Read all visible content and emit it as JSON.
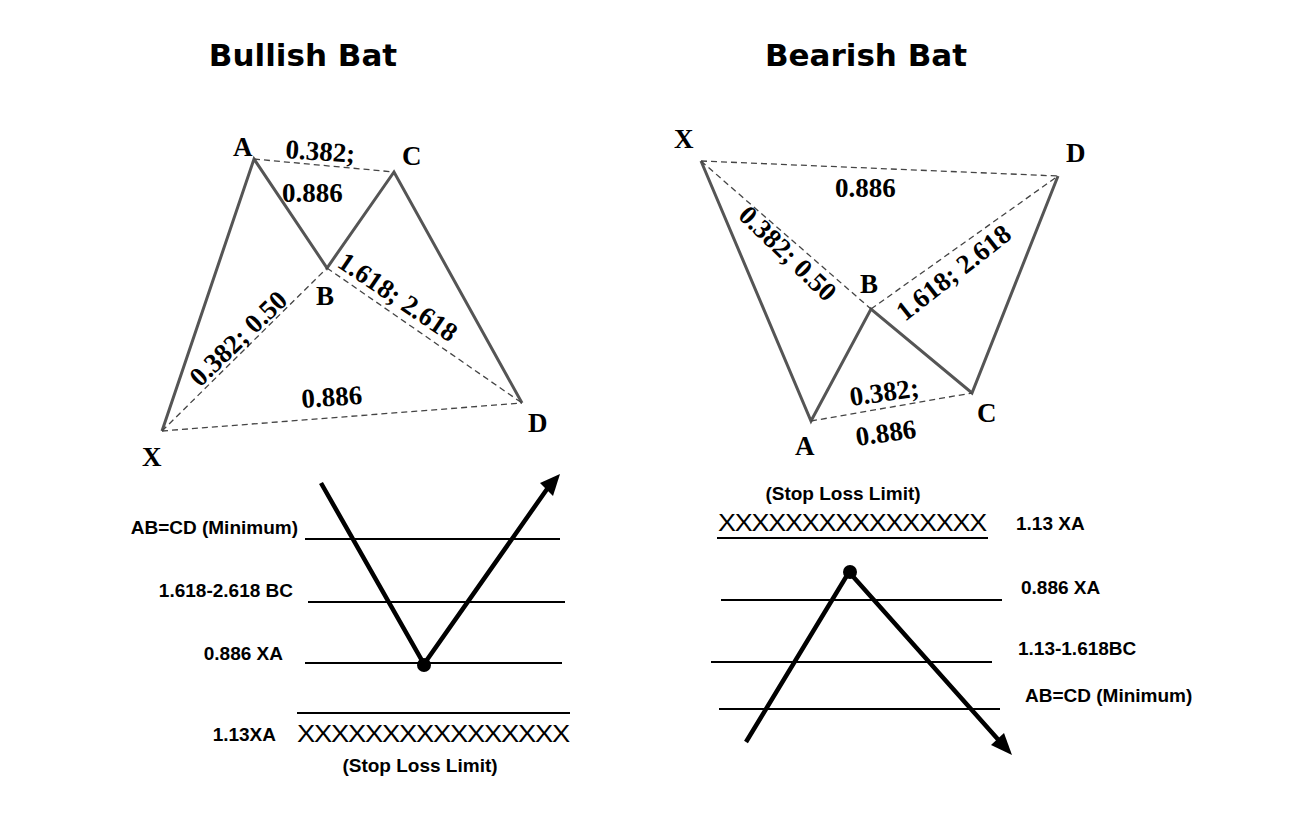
{
  "bullish": {
    "title": "Bullish Bat",
    "points": {
      "X": "X",
      "A": "A",
      "B": "B",
      "C": "C",
      "D": "D"
    },
    "ratios": {
      "ac_top": "0.382;",
      "ac_bottom": "0.886",
      "xb": "0.382; 0.50",
      "bd": "1.618; 2.618",
      "xd": "0.886"
    },
    "levels": [
      {
        "label": "AB=CD (Minimum)"
      },
      {
        "label": "1.618-2.618 BC"
      },
      {
        "label": "0.886 XA"
      },
      {
        "label": "1.13XA"
      }
    ],
    "stop_marks": "XXXXXXXXXXXXXXXX",
    "stop_label": "(Stop Loss Limit)"
  },
  "bearish": {
    "title": "Bearish Bat",
    "points": {
      "X": "X",
      "A": "A",
      "B": "B",
      "C": "C",
      "D": "D"
    },
    "ratios": {
      "xd": "0.886",
      "xb": "0.382; 0.50",
      "bd": "1.618; 2.618",
      "ac_top": "0.382;",
      "ac_bottom": "0.886"
    },
    "levels": [
      {
        "label": "1.13 XA"
      },
      {
        "label": "0.886 XA"
      },
      {
        "label": "1.13-1.618BC"
      },
      {
        "label": "AB=CD (Minimum)"
      }
    ],
    "stop_marks": "XXXXXXXXXXXXXXXX",
    "stop_label": "(Stop Loss Limit)"
  }
}
